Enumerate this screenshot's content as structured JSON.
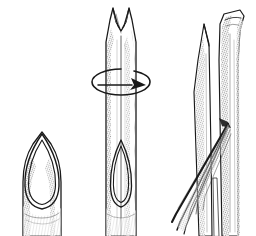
{
  "figure": {
    "title": "Three-step line drawing: notching, rotating and splitting a hollow reed tube",
    "style": "pen-and-ink hatched line art",
    "background_color": "#ffffff",
    "ink_color": "#1a1a1a",
    "panel_count": 3
  },
  "panels": [
    {
      "id": "panel-1",
      "name": "beveled-tube-tip",
      "label": "",
      "description": "Short hollow tube seen end-on with a pointed oval bevel at the top, double outline, hatched shading at the base",
      "bounds": {
        "x": 18,
        "y": 128,
        "width": 52,
        "height": 108
      }
    },
    {
      "id": "panel-2",
      "name": "rotating-notched-tube",
      "label": "",
      "description": "Long vertical tube with a V notch cut into its top end and a circular rotation arrow around the shaft; pointed oval bevel outline visible near the base",
      "bounds": {
        "x": 98,
        "y": 4,
        "width": 46,
        "height": 232
      }
    },
    {
      "id": "panel-3",
      "name": "splitting-fibres",
      "label": "",
      "description": "Rough textured stalk on the right with a sharp sliver blade at its left and long fibre strands being peeled away diagonally toward the lower left",
      "bounds": {
        "x": 176,
        "y": 6,
        "width": 80,
        "height": 230
      }
    }
  ],
  "annotations": {
    "rotation_arrow": {
      "name": "rotation-arrow",
      "shape": "ellipse-with-arrowhead",
      "direction": "clockwise",
      "center_x": 120,
      "center_y": 82,
      "radius_x": 28,
      "radius_y": 13
    },
    "notch": {
      "name": "v-notch",
      "shape": "v-cut",
      "apex_x": 121,
      "apex_y": 30
    }
  }
}
